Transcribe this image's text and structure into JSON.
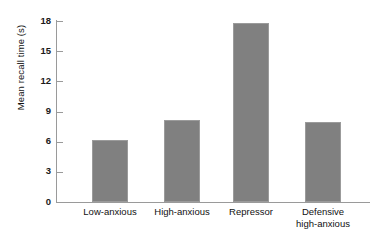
{
  "chart_data": {
    "type": "bar",
    "title": "",
    "xlabel": "",
    "ylabel": "Mean recall time (s)",
    "categories": [
      "Low-anxious",
      "High-anxious",
      "Repressor",
      "Defensive\nhigh-anxious"
    ],
    "values": [
      6.2,
      8.2,
      17.8,
      8.0
    ],
    "ylim": [
      0,
      18
    ],
    "yticks": [
      "0",
      "3",
      "6",
      "9",
      "12",
      "15",
      "18"
    ],
    "ytick_values": [
      0,
      3,
      6,
      9,
      12,
      15,
      18
    ],
    "grid": false,
    "legend": null,
    "bar_color": "#808080",
    "axis_color": "#9a9a9a",
    "text_color": "#111111"
  }
}
